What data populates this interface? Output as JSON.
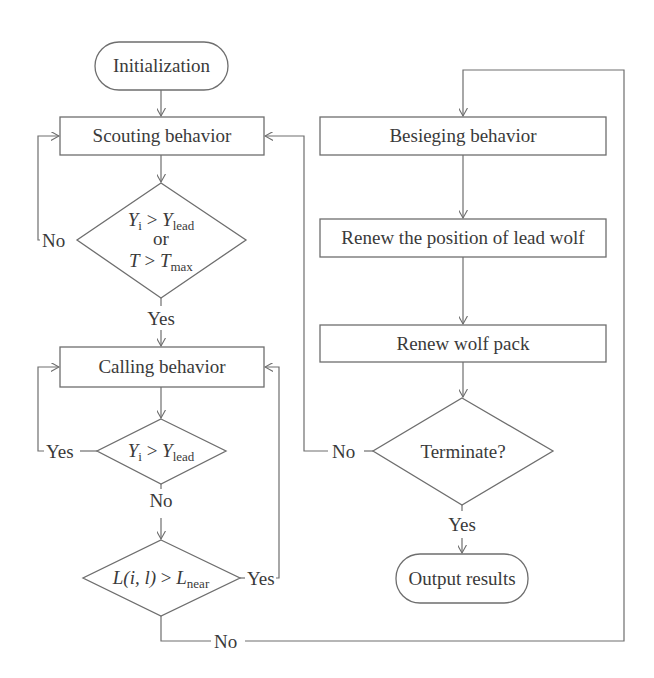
{
  "diagram": {
    "type": "flowchart",
    "colors": {
      "line": "#6e6e6e",
      "text": "#3a3a3a",
      "background": "#ffffff"
    },
    "nodes": {
      "initialization": {
        "shape": "terminal",
        "label": "Initialization"
      },
      "scouting": {
        "shape": "process",
        "label": "Scouting behavior"
      },
      "decision1": {
        "shape": "decision",
        "line1": {
          "var": "Y",
          "var_sub": "i",
          "op": " > ",
          "rhs": "Y",
          "rhs_sub": "lead"
        },
        "line2": "or",
        "line3": {
          "var": "T",
          "op": " > ",
          "rhs": "T",
          "rhs_sub": "max"
        }
      },
      "calling": {
        "shape": "process",
        "label": "Calling behavior"
      },
      "decision2": {
        "shape": "decision",
        "line1": {
          "var": "Y",
          "var_sub": "i",
          "op": " > ",
          "rhs": "Y",
          "rhs_sub": "lead"
        }
      },
      "decision3": {
        "shape": "decision",
        "line1": {
          "lhs": "L(i, l)",
          "op": " > ",
          "rhs": "L",
          "rhs_sub": "near"
        }
      },
      "besieging": {
        "shape": "process",
        "label": "Besieging behavior"
      },
      "renew_lead": {
        "shape": "process",
        "label": "Renew the position of lead wolf"
      },
      "renew_pack": {
        "shape": "process",
        "label": "Renew wolf pack"
      },
      "terminate": {
        "shape": "decision",
        "label": "Terminate?"
      },
      "output": {
        "shape": "terminal",
        "label": "Output results"
      }
    },
    "edge_labels": {
      "d1_no": "No",
      "d1_yes": "Yes",
      "d2_yes": "Yes",
      "d2_no": "No",
      "d3_yes": "Yes",
      "d3_no": "No",
      "term_no": "No",
      "term_yes": "Yes"
    },
    "edges": [
      {
        "from": "initialization",
        "to": "scouting"
      },
      {
        "from": "scouting",
        "to": "decision1"
      },
      {
        "from": "decision1",
        "to": "scouting",
        "label": "No"
      },
      {
        "from": "decision1",
        "to": "calling",
        "label": "Yes"
      },
      {
        "from": "calling",
        "to": "decision2"
      },
      {
        "from": "decision2",
        "to": "calling",
        "label": "Yes"
      },
      {
        "from": "decision2",
        "to": "decision3",
        "label": "No"
      },
      {
        "from": "decision3",
        "to": "calling",
        "label": "Yes"
      },
      {
        "from": "decision3",
        "to": "besieging",
        "label": "No"
      },
      {
        "from": "besieging",
        "to": "renew_lead"
      },
      {
        "from": "renew_lead",
        "to": "renew_pack"
      },
      {
        "from": "renew_pack",
        "to": "terminate"
      },
      {
        "from": "terminate",
        "to": "scouting",
        "label": "No"
      },
      {
        "from": "terminate",
        "to": "output",
        "label": "Yes"
      }
    ]
  }
}
